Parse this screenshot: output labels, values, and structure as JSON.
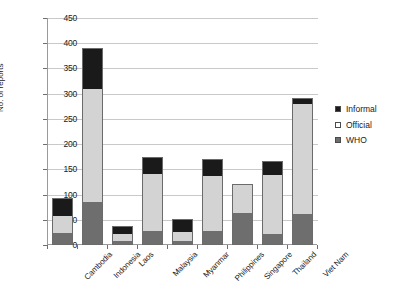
{
  "chart_data": {
    "type": "bar",
    "subtype": "stacked-vertical",
    "title": "",
    "xlabel": "",
    "ylabel": "No. of reports",
    "ylim": [
      0,
      450
    ],
    "yticks": [
      0,
      50,
      100,
      150,
      200,
      250,
      300,
      350,
      400,
      450
    ],
    "grid": true,
    "legend_position": "right",
    "categories": [
      "Cambodia",
      "Indonesia",
      "Laos",
      "Malaysia",
      "Myanmar",
      "Philippines",
      "Singapore",
      "Thailand",
      "Viet Nam"
    ],
    "series": [
      {
        "name": "WHO",
        "color": "#6e6e6e",
        "values": [
          23,
          85,
          6,
          26,
          6,
          26,
          64,
          20,
          60
        ]
      },
      {
        "name": "Official",
        "color": "#d3d3d3",
        "values": [
          36,
          225,
          16,
          117,
          20,
          112,
          56,
          120,
          222
        ]
      },
      {
        "name": "Informal",
        "color": "#1a1a1a",
        "values": [
          34,
          80,
          16,
          32,
          26,
          32,
          0,
          27,
          10
        ]
      }
    ],
    "totals": [
      93,
      390,
      38,
      175,
      52,
      170,
      120,
      167,
      292
    ]
  },
  "legend": {
    "items": [
      {
        "label": "Informal",
        "color": "#1a1a1a"
      },
      {
        "label": "Official",
        "color": "#ffffff"
      },
      {
        "label": "WHO",
        "color": "#6e6e6e"
      }
    ]
  },
  "axis": {
    "y_label": "No. of reports",
    "y_ticks": [
      "450",
      "400",
      "350",
      "300",
      "250",
      "200",
      "150",
      "100",
      "50",
      "0"
    ]
  }
}
